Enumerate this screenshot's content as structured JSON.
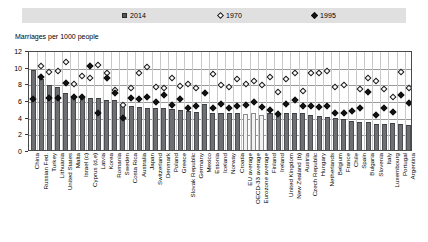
{
  "legend": {
    "items": [
      {
        "label": "2014",
        "marker": "filled-square-icon",
        "color": "#55565a"
      },
      {
        "label": "1970",
        "marker": "open-diamond-icon",
        "color": "#ffffff"
      },
      {
        "label": "1995",
        "marker": "filled-diamond-icon",
        "color": "#111111"
      }
    ]
  },
  "chart_data": {
    "type": "bar",
    "title": "",
    "subtitle": "",
    "ylabel": "Marriages per 1000 people",
    "xlabel": "",
    "ylim": [
      0,
      12
    ],
    "yticks": [
      0,
      2,
      4,
      6,
      8,
      10,
      12
    ],
    "grid": true,
    "legend_position": "top",
    "categories": [
      "China",
      "Russian Fed.",
      "Turkey",
      "Lithuania",
      "United States",
      "Malta",
      "Israel (c)",
      "Cyprus (d,e)",
      "Latvia",
      "Korea",
      "Romania",
      "Sweden",
      "Costa Rica",
      "Australia",
      "Japan",
      "Switzerland",
      "Denmark",
      "Poland",
      "Greece",
      "Slovak Republic",
      "Germany",
      "Mexico",
      "Estonia",
      "Iceland",
      "Norway",
      "Croatia",
      "EU average",
      "OECD-33 average",
      "Eurozone average",
      "Finland",
      "Ireland",
      "United Kingdom",
      "New Zealand (b)",
      "Austria",
      "Czech Republic",
      "Hungary",
      "Netherlands",
      "Belgium",
      "France",
      "Chile",
      "Spain",
      "Bulgaria",
      "Slovenia",
      "Italy",
      "Luxembourg",
      "Portugal",
      "Argentina"
    ],
    "average_categories": [
      "EU average",
      "OECD-33 average",
      "Eurozone average"
    ],
    "series": [
      {
        "name": "2014",
        "type": "bar",
        "values": [
          9.6,
          8.5,
          7.8,
          7.6,
          6.9,
          6.3,
          6.4,
          6.3,
          6.3,
          6.0,
          6.0,
          5.4,
          5.3,
          5.2,
          5.1,
          5.1,
          5.0,
          4.9,
          4.8,
          4.7,
          4.6,
          5.5,
          4.5,
          4.5,
          4.4,
          4.5,
          4.3,
          4.4,
          4.2,
          4.5,
          4.4,
          4.4,
          4.4,
          4.4,
          4.2,
          4.1,
          4.0,
          3.9,
          3.7,
          3.5,
          3.4,
          3.4,
          3.1,
          3.1,
          3.3,
          3.1,
          3.0
        ]
      },
      {
        "name": "1970",
        "type": "scatter",
        "marker": "open-diamond",
        "values": [
          null,
          10.1,
          9.4,
          9.5,
          10.6,
          7.9,
          8.9,
          8.6,
          10.2,
          9.2,
          7.2,
          5.4,
          7.5,
          9.3,
          10.0,
          7.6,
          7.4,
          8.6,
          7.7,
          7.9,
          7.4,
          null,
          9.1,
          7.8,
          7.6,
          8.5,
          7.9,
          8.3,
          7.8,
          8.8,
          7.0,
          8.5,
          9.2,
          7.1,
          9.2,
          9.3,
          9.5,
          7.6,
          7.8,
          null,
          7.3,
          8.6,
          8.3,
          7.3,
          6.4,
          9.4,
          7.4
        ]
      },
      {
        "name": "1995",
        "type": "scatter",
        "marker": "filled-diamond",
        "values": [
          6.1,
          8.8,
          6.2,
          6.3,
          8.0,
          6.4,
          6.4,
          10.1,
          4.5,
          8.7,
          6.8,
          3.8,
          6.3,
          6.1,
          6.4,
          5.8,
          6.6,
          5.4,
          6.1,
          5.1,
          5.3,
          6.8,
          5.0,
          5.5,
          5.0,
          5.3,
          5.4,
          5.8,
          5.2,
          4.8,
          4.3,
          5.5,
          6.0,
          5.3,
          5.3,
          5.2,
          5.3,
          4.4,
          4.4,
          4.7,
          5.0,
          7.0,
          4.2,
          5.0,
          4.6,
          6.6,
          5.6
        ]
      }
    ]
  }
}
